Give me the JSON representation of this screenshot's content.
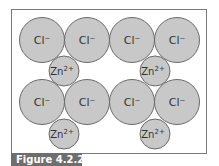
{
  "figure": {
    "caption": "Figure 4.2.2",
    "colors": {
      "ion_fill": "#c8c8c8",
      "ion_stroke": "#6a6a6a",
      "frame": "#7a7a7a",
      "label_bar": "#6e6e6e",
      "label_text": "#ffffff"
    }
  },
  "ions": {
    "chloride": [
      {
        "label": "Cl⁻",
        "cx": 42,
        "cy": 40
      },
      {
        "label": "Cl⁻",
        "cx": 87,
        "cy": 40
      },
      {
        "label": "Cl⁻",
        "cx": 132,
        "cy": 40
      },
      {
        "label": "Cl⁻",
        "cx": 177,
        "cy": 40
      },
      {
        "label": "Cl⁻",
        "cx": 42,
        "cy": 102
      },
      {
        "label": "Cl⁻",
        "cx": 87,
        "cy": 102
      },
      {
        "label": "Cl⁻",
        "cx": 132,
        "cy": 102
      },
      {
        "label": "Cl⁻",
        "cx": 177,
        "cy": 102
      }
    ],
    "zinc": [
      {
        "label": "Zn",
        "charge": "2+",
        "cx": 64,
        "cy": 71
      },
      {
        "label": "Zn",
        "charge": "2+",
        "cx": 155,
        "cy": 71
      },
      {
        "label": "Zn",
        "charge": "2+",
        "cx": 64,
        "cy": 134
      },
      {
        "label": "Zn",
        "charge": "2+",
        "cx": 155,
        "cy": 134
      }
    ]
  }
}
